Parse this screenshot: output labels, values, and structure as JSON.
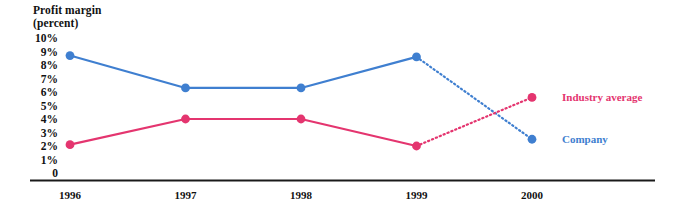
{
  "chart_data": {
    "type": "line",
    "title": "Profit margin\n(percent)",
    "xlabel": "",
    "ylabel": "Profit margin (percent)",
    "categories": [
      "1996",
      "1997",
      "1998",
      "1999",
      "2000"
    ],
    "x": [
      1996,
      1997,
      1998,
      1999,
      2000
    ],
    "ylim": [
      0,
      10
    ],
    "ytick_labels": [
      "10%",
      "9%",
      "8%",
      "7%",
      "6%",
      "5%",
      "4%",
      "3%",
      "2%",
      "1%",
      "0"
    ],
    "ytick_values": [
      10,
      9,
      8,
      7,
      6,
      5,
      4,
      3,
      2,
      1,
      0
    ],
    "grid": false,
    "legend_position": "right",
    "projection_note": "1999-2000 segment drawn dotted (projected)",
    "series": [
      {
        "name": "Company",
        "color": "#3f7fd0",
        "values": [
          8.7,
          6.3,
          6.3,
          8.6,
          2.5
        ],
        "solid_through": 3,
        "dotted_from": 3
      },
      {
        "name": "Industry average",
        "color": "#e4356f",
        "values": [
          2.1,
          4.0,
          4.0,
          2.0,
          5.6
        ],
        "solid_through": 3,
        "dotted_from": 3
      }
    ],
    "legend": [
      {
        "label": "Industry average",
        "color": "#e4356f"
      },
      {
        "label": "Company",
        "color": "#3f7fd0"
      }
    ],
    "axis_color": "#1a1a1a"
  }
}
